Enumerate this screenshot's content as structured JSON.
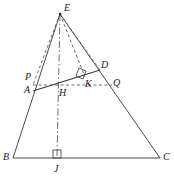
{
  "figure": {
    "type": "geometry-diagram",
    "width": 174,
    "height": 181,
    "background_color": "#ffffff",
    "stroke_color": "#4a4a4a",
    "label_color": "#1a1a1a"
  },
  "labels": {
    "E": "E",
    "D": "D",
    "P": "P",
    "Q": "Q",
    "K": "K",
    "A": "A",
    "H": "H",
    "B": "B",
    "J": "J",
    "C": "C"
  },
  "points": {
    "E": {
      "x": 60,
      "y": 14
    },
    "A": {
      "x": 33,
      "y": 91
    },
    "D": {
      "x": 100,
      "y": 70
    },
    "P": {
      "x": 33,
      "y": 85
    },
    "Q": {
      "x": 112,
      "y": 85
    },
    "K": {
      "x": 85,
      "y": 77
    },
    "H": {
      "x": 60,
      "y": 85
    },
    "B": {
      "x": 13,
      "y": 158
    },
    "J": {
      "x": 57,
      "y": 158
    },
    "C": {
      "x": 160,
      "y": 158
    }
  },
  "label_positions": {
    "E": {
      "x": 64,
      "y": 3
    },
    "D": {
      "x": 101,
      "y": 60
    },
    "P": {
      "x": 25,
      "y": 72
    },
    "Q": {
      "x": 113,
      "y": 78
    },
    "K": {
      "x": 85,
      "y": 79
    },
    "A": {
      "x": 24,
      "y": 85
    },
    "H": {
      "x": 59,
      "y": 88
    },
    "B": {
      "x": 3,
      "y": 152
    },
    "J": {
      "x": 54,
      "y": 164
    },
    "C": {
      "x": 163,
      "y": 152
    }
  },
  "segments": [
    {
      "name": "side-BE",
      "from": "B",
      "to": "E",
      "style": "solid"
    },
    {
      "name": "side-EC",
      "from": "E",
      "to": "C",
      "style": "solid"
    },
    {
      "name": "base-BC",
      "from": "B",
      "to": "C",
      "style": "solid"
    },
    {
      "name": "chord-AD",
      "from": "A",
      "to": "D",
      "style": "solid"
    },
    {
      "name": "cevian-EP",
      "from": "E",
      "to": "P",
      "style": "dashed"
    },
    {
      "name": "cevian-EK",
      "from": "E",
      "to": "K",
      "style": "dashed"
    },
    {
      "name": "cevian-ED",
      "from": "E",
      "to": "D",
      "style": "dashed"
    },
    {
      "name": "transversal-PQ",
      "from": "P",
      "to": "Q",
      "style": "dashed"
    },
    {
      "name": "axis-EJ",
      "from": "E",
      "to": "J",
      "style": "dash-dot"
    }
  ],
  "right_angles": [
    {
      "name": "right-angle-at-K",
      "vertex": "K",
      "size": 8
    },
    {
      "name": "right-angle-at-J",
      "vertex": "J",
      "size": 8
    }
  ]
}
